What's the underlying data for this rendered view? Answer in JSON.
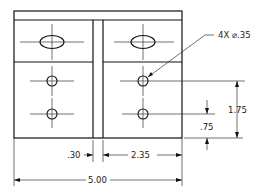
{
  "drawing": {
    "type": "orthographic-view",
    "annotations": {
      "hole_callout": "4X ⌀.35",
      "dim_height_total": "1.75",
      "dim_height_lower": ".75",
      "dim_slot_width": ".30",
      "dim_right_block": "2.35",
      "dim_overall_width": "5.00"
    },
    "colors": {
      "line": "#111111",
      "background": "#ffffff"
    }
  }
}
